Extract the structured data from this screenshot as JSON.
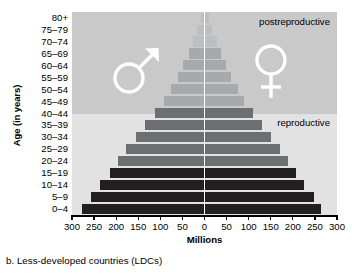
{
  "figure": {
    "caption": "b. Less-developed countries (LDCs)",
    "y_axis_title": "Age (in years)",
    "x_axis_title": "Millions",
    "annotations": {
      "postreproductive": "postreproductive",
      "reproductive": "reproductive"
    },
    "symbols": {
      "male": "male-symbol",
      "female": "female-symbol"
    },
    "colors": {
      "band_postreproductive": "#c9c9c9",
      "band_reproductive": "#e2e2e2",
      "bar_dark": "#231f20",
      "bar_mid": "#6d6e71",
      "bar_light": "#a7a9ac",
      "bar_lighter": "#bcbec0",
      "axis": "#000000",
      "center_line": "#ffffff"
    }
  },
  "chart_data": {
    "type": "bar",
    "title": "b. Less-developed countries (LDCs)",
    "subtitle": "",
    "xlabel": "Millions",
    "ylabel": "Age (in years)",
    "orientation": "horizontal-diverging",
    "xlim": [
      -300,
      300
    ],
    "xticks": [
      300,
      250,
      200,
      150,
      100,
      50,
      0,
      50,
      100,
      150,
      200,
      250,
      300
    ],
    "xtick_labels": [
      "300",
      "250",
      "200",
      "150",
      "100",
      "50",
      "0",
      "50",
      "100",
      "150",
      "200",
      "250",
      "300"
    ],
    "grid": false,
    "legend": null,
    "categories": [
      "0–4",
      "5–9",
      "10–14",
      "15–19",
      "20–24",
      "25–29",
      "30–34",
      "35–39",
      "40–44",
      "45–49",
      "50–54",
      "55–59",
      "60–64",
      "65–69",
      "70–74",
      "75–79",
      "80+"
    ],
    "series": [
      {
        "name": "Male",
        "side": "left",
        "values": [
          277,
          258,
          236,
          215,
          196,
          178,
          156,
          135,
          113,
          92,
          76,
          61,
          48,
          36,
          26,
          16,
          9
        ]
      },
      {
        "name": "Female",
        "side": "right",
        "values": [
          264,
          247,
          226,
          207,
          190,
          172,
          151,
          131,
          110,
          90,
          75,
          61,
          49,
          38,
          28,
          18,
          11
        ]
      }
    ],
    "bar_shades": [
      "dark",
      "dark",
      "dark",
      "dark",
      "mid",
      "mid",
      "mid",
      "mid",
      "mid",
      "light",
      "light",
      "light",
      "light",
      "light",
      "lighter",
      "lighter",
      "lighter"
    ],
    "bands": [
      {
        "label": "postreproductive",
        "from_category": "45–49",
        "to_category": "80+"
      },
      {
        "label": "reproductive",
        "from_category": "0–4",
        "to_category": "40–44"
      }
    ]
  }
}
